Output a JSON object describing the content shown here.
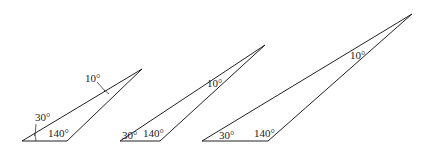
{
  "diagram": {
    "stroke_color": "#222222",
    "background": "#ffffff",
    "triangles": [
      {
        "id": "triangle-1",
        "vertices": {
          "base_left": [
            22,
            141
          ],
          "base_right": [
            67,
            141
          ],
          "apex": [
            142,
            69
          ]
        },
        "labels": {
          "angle_left": "30°",
          "angle_right": "140°",
          "angle_apex": "10°"
        }
      },
      {
        "id": "triangle-2",
        "vertices": {
          "base_left": [
            120,
            141
          ],
          "base_right": [
            160,
            141
          ],
          "apex": [
            265,
            45
          ]
        },
        "labels": {
          "angle_left": "30°",
          "angle_right": "140°",
          "angle_apex": "10°"
        }
      },
      {
        "id": "triangle-3",
        "vertices": {
          "base_left": [
            202,
            141
          ],
          "base_right": [
            268,
            141
          ],
          "apex": [
            412,
            14
          ]
        },
        "labels": {
          "angle_left": "30°",
          "angle_right": "140°",
          "angle_apex": "10°"
        }
      }
    ]
  }
}
